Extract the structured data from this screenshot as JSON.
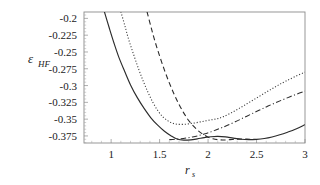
{
  "chart_data": {
    "type": "line",
    "title": "",
    "xlabel": "r_s",
    "xlabel_main": "r",
    "xlabel_subscript": "s",
    "ylabel": "ε_HF",
    "ylabel_main": "ε",
    "ylabel_subscript": "HF",
    "xlim": [
      0.72,
      3.0
    ],
    "ylim": [
      -0.3855,
      -0.1905
    ],
    "xticks": [
      1,
      1.5,
      2,
      2.5,
      3
    ],
    "xticklabels": [
      "1",
      "1.5",
      "2",
      "2.5",
      "3"
    ],
    "yticks": [
      -0.2,
      -0.225,
      -0.25,
      -0.275,
      -0.3,
      -0.325,
      -0.35,
      -0.375
    ],
    "yticklabels": [
      "-0.2",
      "-0.225",
      "-0.25",
      "-0.275",
      "-0.3",
      "-0.325",
      "-0.35",
      "-0.375"
    ],
    "grid": false,
    "legend": "none",
    "axis_color": "#8c8c8c",
    "curve_color": "#1a1a1a",
    "series": [
      {
        "name": "solid-curve",
        "style": "solid",
        "dasharray": "none",
        "color": "#2b2b2b",
        "width": 1.15,
        "x": [
          0.93,
          0.98,
          1.03,
          1.08,
          1.14,
          1.2,
          1.27,
          1.34,
          1.41,
          1.48,
          1.55,
          1.62,
          1.68,
          1.75,
          1.82,
          1.89,
          1.96,
          2.03,
          2.1,
          2.18,
          2.26,
          2.34,
          2.42,
          2.5,
          2.58,
          2.66,
          2.74,
          2.82,
          2.9,
          3.0
        ],
        "y": [
          -0.19,
          -0.214,
          -0.237,
          -0.258,
          -0.279,
          -0.299,
          -0.318,
          -0.334,
          -0.348,
          -0.359,
          -0.368,
          -0.375,
          -0.3795,
          -0.3812,
          -0.3808,
          -0.3793,
          -0.3775,
          -0.3762,
          -0.3757,
          -0.3764,
          -0.3783,
          -0.3799,
          -0.3805,
          -0.3801,
          -0.3788,
          -0.3765,
          -0.3733,
          -0.3694,
          -0.365,
          -0.3582
        ]
      },
      {
        "name": "dotted-curve",
        "style": "dotted",
        "dasharray": "1.1,1.9",
        "color": "#3a3a3a",
        "width": 1.1,
        "x": [
          1.1,
          1.14,
          1.18,
          1.23,
          1.28,
          1.33,
          1.38,
          1.43,
          1.48,
          1.53,
          1.58,
          1.63,
          1.68,
          1.74,
          1.8,
          1.86,
          1.92,
          1.98,
          2.04,
          2.1,
          2.16,
          2.24,
          2.32,
          2.4,
          2.48,
          2.56,
          2.64,
          2.72,
          2.8,
          2.9,
          3.0
        ],
        "y": [
          -0.19,
          -0.21,
          -0.231,
          -0.253,
          -0.274,
          -0.293,
          -0.31,
          -0.325,
          -0.337,
          -0.346,
          -0.352,
          -0.3558,
          -0.3575,
          -0.3578,
          -0.357,
          -0.3557,
          -0.3541,
          -0.3524,
          -0.3508,
          -0.3492,
          -0.3462,
          -0.3405,
          -0.334,
          -0.3272,
          -0.3202,
          -0.3133,
          -0.3064,
          -0.2997,
          -0.2936,
          -0.2865,
          -0.28
        ]
      },
      {
        "name": "dashed-curve",
        "style": "dashed",
        "dasharray": "5,3.2",
        "color": "#2b2b2b",
        "width": 1.1,
        "x": [
          1.37,
          1.41,
          1.45,
          1.5,
          1.55,
          1.6,
          1.65,
          1.7,
          1.75,
          1.8,
          1.85,
          1.9,
          1.95,
          2.0,
          2.05,
          2.1,
          2.15,
          2.2,
          2.25,
          2.3,
          2.35,
          2.4,
          2.45,
          2.5
        ],
        "y": [
          -0.19,
          -0.212,
          -0.233,
          -0.256,
          -0.277,
          -0.296,
          -0.313,
          -0.328,
          -0.341,
          -0.352,
          -0.3605,
          -0.3675,
          -0.3728,
          -0.3768,
          -0.3793,
          -0.3806,
          -0.381,
          -0.3808,
          -0.3803,
          -0.3798,
          -0.3795,
          -0.3796,
          -0.38,
          -0.3803
        ]
      },
      {
        "name": "dash-dot-curve",
        "style": "dashdot",
        "dasharray": "5.5,2.4,1.1,2.4",
        "color": "#2b2b2b",
        "width": 1.05,
        "x": [
          1.6,
          1.66,
          1.72,
          1.78,
          1.84,
          1.9,
          1.96,
          2.02,
          2.08,
          2.14,
          2.2,
          2.28,
          2.36,
          2.44,
          2.52,
          2.6,
          2.68,
          2.76,
          2.84,
          2.92,
          3.0
        ],
        "y": [
          -0.3805,
          -0.38,
          -0.3792,
          -0.378,
          -0.3765,
          -0.3746,
          -0.3722,
          -0.3694,
          -0.3662,
          -0.3628,
          -0.3592,
          -0.354,
          -0.3484,
          -0.3428,
          -0.3372,
          -0.3318,
          -0.3266,
          -0.3217,
          -0.317,
          -0.3126,
          -0.3085
        ]
      }
    ]
  },
  "axes": {
    "plot_left_px": 84,
    "plot_top_px": 12,
    "plot_right_px": 305,
    "plot_bottom_px": 143
  }
}
